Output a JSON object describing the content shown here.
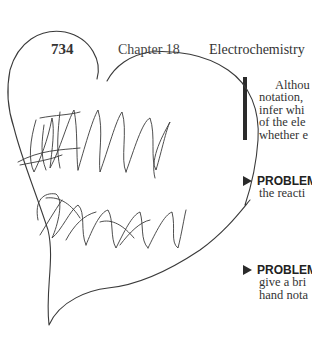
{
  "header": {
    "page_number": "734",
    "chapter_label": "Chapter 18",
    "chapter_title": "Electrochemistry"
  },
  "paragraph": {
    "lines": [
      "Althou",
      "notation,",
      "infer whi",
      "of the ele",
      "whether e"
    ]
  },
  "problems": [
    {
      "label": "PROBLEM",
      "lines": [
        "the reacti"
      ]
    },
    {
      "label": "PROBLEM",
      "lines": [
        "give a bri",
        "hand nota"
      ]
    }
  ],
  "annotations": {
    "heart_outline": "hand-drawn heart",
    "scribbles": [
      "scribble-top",
      "scribble-bottom"
    ],
    "ink_color": "#3a3a3a"
  }
}
